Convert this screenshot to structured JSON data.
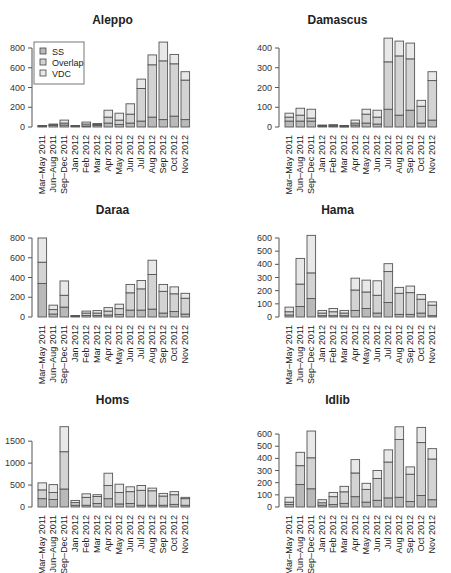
{
  "colors": {
    "ss": "#b9b9b9",
    "overlap": "#d3d3d3",
    "vdc": "#e8e8e8",
    "stroke": "#555555",
    "axis": "#555555"
  },
  "legend": {
    "items": [
      "SS",
      "Overlap",
      "VDC"
    ]
  },
  "categories": [
    "Mar–May 2011",
    "Jun–Aug 2011",
    "Sep–Dec 2011",
    "Jan 2012",
    "Feb 2012",
    "Mar 2012",
    "Apr 2012",
    "May 2012",
    "Jun 2012",
    "Jul 2012",
    "Aug 2012",
    "Sep 2012",
    "Oct 2012",
    "Nov 2012"
  ],
  "chart_data": [
    {
      "type": "bar",
      "stacked": true,
      "title": "Aleppo",
      "xlabel": "",
      "ylabel": "",
      "categories": [
        "Mar–May 2011",
        "Jun–Aug 2011",
        "Sep–Dec 2011",
        "Jan 2012",
        "Feb 2012",
        "Mar 2012",
        "Apr 2012",
        "May 2012",
        "Jun 2012",
        "Jul 2012",
        "Aug 2012",
        "Sep 2012",
        "Oct 2012",
        "Nov 2012"
      ],
      "ylim": [
        0,
        800
      ],
      "yticks": [
        0,
        200,
        400,
        600,
        800
      ],
      "legend_position": "topleft",
      "series": [
        {
          "name": "SS",
          "values": [
            5,
            15,
            20,
            5,
            10,
            15,
            40,
            25,
            40,
            60,
            100,
            75,
            110,
            75
          ]
        },
        {
          "name": "Overlap",
          "values": [
            5,
            5,
            20,
            5,
            20,
            10,
            60,
            45,
            90,
            330,
            530,
            595,
            530,
            400
          ]
        },
        {
          "name": "VDC",
          "values": [
            5,
            10,
            30,
            5,
            20,
            10,
            70,
            70,
            105,
            95,
            100,
            190,
            95,
            85
          ]
        }
      ]
    },
    {
      "type": "bar",
      "stacked": true,
      "title": "Damascus",
      "xlabel": "",
      "ylabel": "",
      "categories": [
        "Mar–May 2011",
        "Jun–Aug 2011",
        "Sep–Dec 2011",
        "Jan 2012",
        "Feb 2012",
        "Mar 2012",
        "Apr 2012",
        "May 2012",
        "Jun 2012",
        "Jul 2012",
        "Aug 2012",
        "Sep 2012",
        "Oct 2012",
        "Nov 2012"
      ],
      "ylim": [
        0,
        400
      ],
      "yticks": [
        0,
        100,
        200,
        300,
        400
      ],
      "series": [
        {
          "name": "SS",
          "values": [
            30,
            30,
            30,
            3,
            3,
            2,
            10,
            20,
            15,
            90,
            60,
            85,
            20,
            35
          ]
        },
        {
          "name": "Overlap",
          "values": [
            20,
            30,
            15,
            3,
            5,
            3,
            10,
            45,
            35,
            240,
            300,
            260,
            85,
            200
          ]
        },
        {
          "name": "VDC",
          "values": [
            20,
            35,
            45,
            4,
            4,
            3,
            15,
            25,
            35,
            120,
            75,
            80,
            30,
            45
          ]
        }
      ]
    },
    {
      "type": "bar",
      "stacked": true,
      "title": "Daraa",
      "xlabel": "",
      "ylabel": "",
      "categories": [
        "Mar–May 2011",
        "Jun–Aug 2011",
        "Sep–Dec 2011",
        "Jan 2012",
        "Feb 2012",
        "Mar 2012",
        "Apr 2012",
        "May 2012",
        "Jun 2012",
        "Jul 2012",
        "Aug 2012",
        "Sep 2012",
        "Oct 2012",
        "Nov 2012"
      ],
      "ylim": [
        0,
        800
      ],
      "yticks": [
        0,
        200,
        400,
        600,
        800
      ],
      "series": [
        {
          "name": "SS",
          "values": [
            340,
            30,
            100,
            5,
            15,
            15,
            20,
            25,
            70,
            70,
            80,
            40,
            55,
            30
          ]
        },
        {
          "name": "Overlap",
          "values": [
            215,
            45,
            120,
            5,
            25,
            25,
            40,
            60,
            175,
            215,
            350,
            220,
            180,
            160
          ]
        },
        {
          "name": "VDC",
          "values": [
            245,
            45,
            145,
            5,
            20,
            25,
            35,
            45,
            85,
            85,
            145,
            70,
            70,
            50
          ]
        }
      ]
    },
    {
      "type": "bar",
      "stacked": true,
      "title": "Hama",
      "xlabel": "",
      "ylabel": "",
      "categories": [
        "Mar–May 2011",
        "Jun–Aug 2011",
        "Sep–Dec 2011",
        "Jan 2012",
        "Feb 2012",
        "Mar 2012",
        "Apr 2012",
        "May 2012",
        "Jun 2012",
        "Jul 2012",
        "Aug 2012",
        "Sep 2012",
        "Oct 2012",
        "Nov 2012"
      ],
      "ylim": [
        0,
        600
      ],
      "yticks": [
        0,
        100,
        200,
        300,
        400,
        500,
        600
      ],
      "series": [
        {
          "name": "SS",
          "values": [
            15,
            80,
            140,
            10,
            10,
            10,
            50,
            65,
            30,
            110,
            20,
            20,
            30,
            10
          ]
        },
        {
          "name": "Overlap",
          "values": [
            25,
            170,
            195,
            20,
            30,
            20,
            155,
            125,
            135,
            235,
            160,
            165,
            105,
            80
          ]
        },
        {
          "name": "VDC",
          "values": [
            35,
            195,
            285,
            20,
            25,
            20,
            90,
            90,
            110,
            60,
            45,
            50,
            35,
            25
          ]
        }
      ]
    },
    {
      "type": "bar",
      "stacked": true,
      "title": "Homs",
      "xlabel": "",
      "ylabel": "",
      "categories": [
        "Mar–May 2011",
        "Jun–Aug 2011",
        "Sep–Dec 2011",
        "Jan 2012",
        "Feb 2012",
        "Mar 2012",
        "Apr 2012",
        "May 2012",
        "Jun 2012",
        "Jul 2012",
        "Aug 2012",
        "Sep 2012",
        "Oct 2012",
        "Nov 2012"
      ],
      "ylim": [
        0,
        1800
      ],
      "yticks": [
        0,
        500,
        1000,
        1500
      ],
      "series": [
        {
          "name": "SS",
          "values": [
            190,
            170,
            410,
            40,
            40,
            80,
            190,
            70,
            80,
            40,
            40,
            40,
            60,
            40
          ]
        },
        {
          "name": "Overlap",
          "values": [
            200,
            160,
            850,
            60,
            180,
            160,
            300,
            260,
            270,
            340,
            330,
            210,
            220,
            150
          ]
        },
        {
          "name": "VDC",
          "values": [
            160,
            180,
            570,
            50,
            80,
            40,
            280,
            190,
            110,
            110,
            60,
            60,
            70,
            30
          ]
        }
      ]
    },
    {
      "type": "bar",
      "stacked": true,
      "title": "Idlib",
      "xlabel": "",
      "ylabel": "",
      "categories": [
        "Mar–May 2011",
        "Jun–Aug 2011",
        "Sep–Dec 2011",
        "Jan 2012",
        "Feb 2012",
        "Mar 2012",
        "Apr 2012",
        "May 2012",
        "Jun 2012",
        "Jul 2012",
        "Aug 2012",
        "Sep 2012",
        "Oct 2012",
        "Nov 2012"
      ],
      "ylim": [
        0,
        650
      ],
      "yticks": [
        0,
        100,
        200,
        300,
        400,
        500,
        600
      ],
      "series": [
        {
          "name": "SS",
          "values": [
            20,
            185,
            150,
            15,
            20,
            30,
            85,
            40,
            55,
            75,
            80,
            45,
            95,
            60
          ]
        },
        {
          "name": "Overlap",
          "values": [
            20,
            155,
            255,
            20,
            65,
            95,
            195,
            105,
            180,
            295,
            475,
            225,
            435,
            335
          ]
        },
        {
          "name": "VDC",
          "values": [
            40,
            110,
            220,
            25,
            35,
            45,
            110,
            50,
            65,
            100,
            105,
            60,
            125,
            85
          ]
        }
      ]
    }
  ]
}
